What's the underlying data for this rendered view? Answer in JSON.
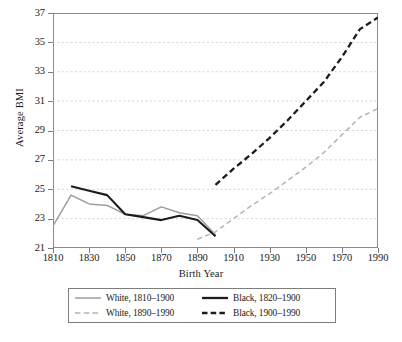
{
  "figure": {
    "type": "line-chart",
    "background": "#ffffff"
  },
  "axes": {
    "y_title": "Average BMI",
    "x_title": "Birth Year",
    "y_ticks": [
      "21",
      "23",
      "25",
      "27",
      "29",
      "31",
      "33",
      "35",
      "37"
    ],
    "x_ticks": [
      "1810",
      "1830",
      "1850",
      "1870",
      "1890",
      "1910",
      "1930",
      "1950",
      "1970",
      "1990"
    ]
  },
  "legend": {
    "items": [
      {
        "label": "White, 1810–1900",
        "style": "solid",
        "color": "#9d9d9d"
      },
      {
        "label": "Black, 1820–1900",
        "style": "solid",
        "color": "#1c1c1c"
      },
      {
        "label": "White, 1890–1990",
        "style": "dashed",
        "color": "#b4b4b4"
      },
      {
        "label": "Black, 1900–1990",
        "style": "dashed",
        "color": "#1c1c1c"
      }
    ]
  },
  "caption": {
    "text": ""
  },
  "colors": {
    "white_solid": "#9d9d9d",
    "black_solid": "#1c1c1c",
    "white_dashed": "#b4b4b4",
    "black_dashed": "#1c1c1c",
    "gridline": "#c9c9c9",
    "axis": "#8a8a8a"
  },
  "chart_data": {
    "type": "line",
    "title": "",
    "xlabel": "Birth Year",
    "ylabel": "Average BMI",
    "xlim": [
      1810,
      1990
    ],
    "ylim": [
      21,
      37
    ],
    "xticks": [
      1810,
      1830,
      1850,
      1870,
      1890,
      1910,
      1930,
      1950,
      1970,
      1990
    ],
    "yticks": [
      21,
      23,
      25,
      27,
      29,
      31,
      33,
      35,
      37
    ],
    "grid": "horizontal-dotted",
    "legend_position": "below-plot",
    "series": [
      {
        "name": "White, 1810–1900",
        "style": "solid",
        "color": "#9d9d9d",
        "x": [
          1810,
          1820,
          1830,
          1840,
          1850,
          1860,
          1870,
          1880,
          1890,
          1900
        ],
        "values": [
          22.5,
          24.6,
          24.0,
          23.9,
          23.3,
          23.2,
          23.8,
          23.4,
          23.2,
          21.9
        ]
      },
      {
        "name": "Black, 1820–1900",
        "style": "solid",
        "color": "#1c1c1c",
        "x": [
          1820,
          1830,
          1840,
          1850,
          1860,
          1870,
          1880,
          1890,
          1900
        ],
        "values": [
          25.2,
          24.9,
          24.6,
          23.3,
          23.1,
          22.9,
          23.2,
          22.9,
          21.8
        ]
      },
      {
        "name": "White, 1890–1990",
        "style": "dashed",
        "color": "#b4b4b4",
        "x": [
          1890,
          1900,
          1910,
          1920,
          1930,
          1940,
          1950,
          1960,
          1970,
          1980,
          1990
        ],
        "values": [
          21.6,
          22.1,
          23.0,
          23.9,
          24.7,
          25.6,
          26.5,
          27.5,
          28.7,
          29.9,
          30.5
        ]
      },
      {
        "name": "Black, 1900–1990",
        "style": "dashed",
        "color": "#1c1c1c",
        "x": [
          1900,
          1910,
          1920,
          1930,
          1940,
          1950,
          1960,
          1970,
          1980,
          1990
        ],
        "values": [
          25.3,
          26.4,
          27.4,
          28.5,
          29.7,
          31.0,
          32.3,
          34.0,
          35.9,
          36.7
        ]
      }
    ]
  }
}
